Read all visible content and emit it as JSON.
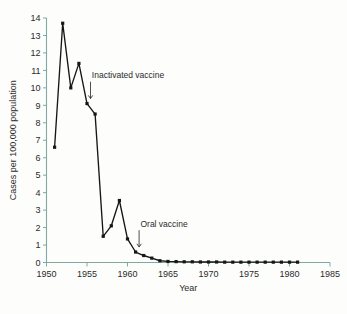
{
  "chart_data": {
    "type": "line",
    "title": "",
    "subtitle": "",
    "xlabel": "Year",
    "ylabel": "Cases per 100,000 population",
    "xlim": [
      1950,
      1985
    ],
    "ylim": [
      0,
      14
    ],
    "grid": false,
    "legend_position": "none",
    "x_ticks": [
      "1950",
      "1955",
      "1960",
      "1965",
      "1970",
      "1975",
      "1980",
      "1985"
    ],
    "x_tick_values": [
      1950,
      1955,
      1960,
      1965,
      1970,
      1975,
      1980,
      1985
    ],
    "y_ticks": [
      "0",
      "1",
      "2",
      "3",
      "4",
      "5",
      "6",
      "7",
      "8",
      "9",
      "10",
      "11",
      "12",
      "13",
      "14"
    ],
    "y_tick_values": [
      0,
      1,
      2,
      3,
      4,
      5,
      6,
      7,
      8,
      9,
      10,
      11,
      12,
      13,
      14
    ],
    "x": [
      1951,
      1952,
      1953,
      1954,
      1955,
      1956,
      1957,
      1958,
      1959,
      1960,
      1961,
      1962,
      1963,
      1964,
      1965,
      1966,
      1967,
      1968,
      1969,
      1970,
      1971,
      1972,
      1973,
      1974,
      1975,
      1976,
      1977,
      1978,
      1979,
      1980,
      1981
    ],
    "values": [
      6.6,
      13.7,
      10.0,
      11.4,
      9.1,
      8.5,
      1.5,
      2.1,
      3.55,
      1.35,
      0.6,
      0.4,
      0.25,
      0.1,
      0.06,
      0.05,
      0.04,
      0.04,
      0.03,
      0.03,
      0.03,
      0.02,
      0.02,
      0.02,
      0.02,
      0.02,
      0.02,
      0.02,
      0.02,
      0.02,
      0.02
    ],
    "series": [
      {
        "name": "Poliomyelitis cases",
        "values": [
          6.6,
          13.7,
          10.0,
          11.4,
          9.1,
          8.5,
          1.5,
          2.1,
          3.55,
          1.35,
          0.6,
          0.4,
          0.25,
          0.1,
          0.06,
          0.05,
          0.04,
          0.04,
          0.03,
          0.03,
          0.03,
          0.02,
          0.02,
          0.02,
          0.02,
          0.02,
          0.02,
          0.02,
          0.02,
          0.02,
          0.02
        ]
      }
    ],
    "annotations": [
      {
        "label": "Inactivated vaccine",
        "x": 1955,
        "y": 9.1,
        "label_x": 1955.6,
        "label_y": 10.55
      },
      {
        "label": "Oral vaccine",
        "x": 1961,
        "y": 0.6,
        "label_x": 1961.6,
        "label_y": 2.05
      }
    ],
    "colors": {
      "line": "#161616",
      "marker": "#161616",
      "axis": "#7fa9a2",
      "text": "#2b2b2b",
      "background": "#fdfdfc"
    }
  }
}
